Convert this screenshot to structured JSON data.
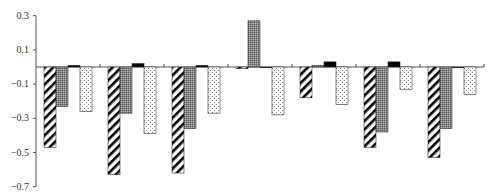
{
  "chart_data": {
    "type": "bar",
    "title": "",
    "xlabel": "",
    "ylabel": "",
    "ylim": [
      -0.7,
      0.3
    ],
    "yticks": [
      0.3,
      0.1,
      -0.1,
      -0.3,
      -0.5,
      -0.7
    ],
    "ytick_labels": [
      "0.3",
      "0.1",
      "−0.1",
      "−0.3",
      "−0.5",
      "−0.7"
    ],
    "grid": false,
    "legend": null,
    "categories": [
      "",
      "",
      "",
      "",
      "",
      "",
      ""
    ],
    "series": [
      {
        "name": "series-1",
        "pattern": "diagonal-hatch",
        "values": [
          -0.47,
          -0.63,
          -0.62,
          -0.01,
          -0.18,
          -0.47,
          -0.53
        ]
      },
      {
        "name": "series-2",
        "pattern": "dark-grey-dotted",
        "values": [
          -0.23,
          -0.27,
          -0.36,
          0.27,
          0.01,
          -0.38,
          -0.36
        ]
      },
      {
        "name": "series-3",
        "pattern": "solid-black",
        "values": [
          0.01,
          0.02,
          0.01,
          0.0,
          0.03,
          0.03,
          0.0
        ]
      },
      {
        "name": "series-4",
        "pattern": "light-dotted",
        "values": [
          -0.26,
          -0.39,
          -0.27,
          -0.28,
          -0.22,
          -0.13,
          -0.16
        ]
      }
    ]
  }
}
